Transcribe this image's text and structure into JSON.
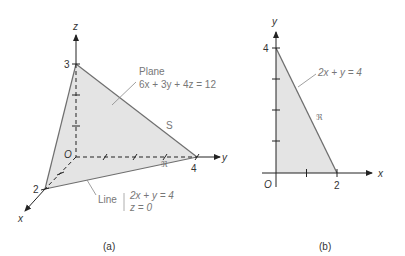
{
  "figure_a": {
    "caption": "(a)",
    "axes": {
      "x": "x",
      "y": "y",
      "z": "z",
      "origin": "O"
    },
    "intercepts": {
      "x": "2",
      "y": "4",
      "z": "3"
    },
    "plane_label": "Plane",
    "plane_equation": "6x + 3y + 4z = 12",
    "surface_label": "S",
    "region_label": "ℜ",
    "line_label": "Line",
    "line_eq_1": "2x + y = 4",
    "line_eq_2": "z = 0"
  },
  "figure_b": {
    "caption": "(b)",
    "axes": {
      "x": "x",
      "y": "y",
      "origin": "O"
    },
    "intercepts": {
      "x": "2",
      "y": "4"
    },
    "line_equation": "2x + y = 4",
    "region_label": "ℜ"
  },
  "colors": {
    "fill": "#e4e4e4",
    "edge": "#6f6f6f",
    "axis": "#333333",
    "text_light": "#777777"
  }
}
